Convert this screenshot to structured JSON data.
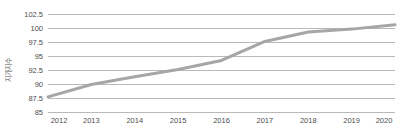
{
  "chart_data": {
    "type": "line",
    "title": "",
    "xlabel": "",
    "ylabel": "지가지수",
    "categories": [
      "2012",
      "2013",
      "2014",
      "2015",
      "2016",
      "2017",
      "2018",
      "2019",
      "2020"
    ],
    "x": [
      2012,
      2013,
      2014,
      2015,
      2016,
      2017,
      2018,
      2019,
      2020
    ],
    "series": [
      {
        "name": "지가지수",
        "color": "#a6a6a6",
        "values": [
          87.7,
          89.9,
          91.3,
          92.6,
          94.2,
          97.6,
          99.3,
          99.8,
          100.6
        ]
      }
    ],
    "ylim": [
      85,
      102.5
    ],
    "yticks": [
      "85",
      "87.5",
      "90",
      "92.5",
      "95",
      "97.5",
      "100",
      "102.5"
    ],
    "ytick_values": [
      85,
      87.5,
      90,
      92.5,
      95,
      97.5,
      100,
      102.5
    ],
    "xtick_labels": [
      "2012",
      "2013",
      "2014",
      "2015",
      "2016",
      "2017",
      "2018",
      "2019",
      "2020"
    ],
    "grid": true,
    "grid_color": "#b9b9b9",
    "legend": false,
    "legend_position": "none",
    "background": "#ffffff",
    "line_color": "#a6a6a6",
    "line_width": 3,
    "markers": false
  }
}
